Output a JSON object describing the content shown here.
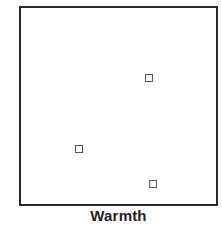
{
  "chart_data": {
    "type": "scatter",
    "title": "",
    "xlabel": "Warmth",
    "ylabel": "",
    "grid": false,
    "legend": null,
    "xlim": [
      0,
      1
    ],
    "ylim": [
      0,
      1
    ],
    "marker": "hollow-square",
    "points": [
      {
        "x": 0.66,
        "y": 0.64
      },
      {
        "x": 0.3,
        "y": 0.28
      },
      {
        "x": 0.68,
        "y": 0.1
      }
    ]
  },
  "colors": {
    "axis": "#2a2a2a",
    "marker": "#555555",
    "label": "#222222",
    "background": "#ffffff"
  }
}
